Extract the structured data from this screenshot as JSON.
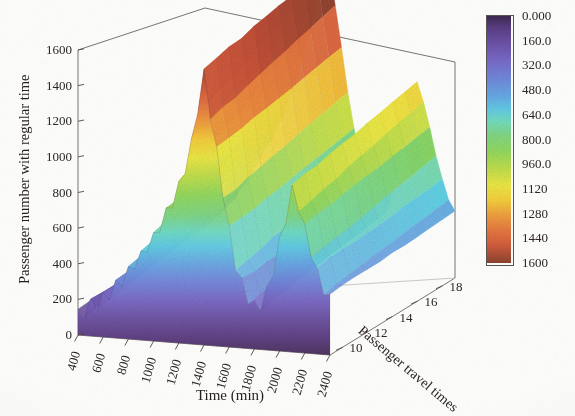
{
  "chart_data": {
    "type": "surface3d",
    "title": "",
    "xlabel": "Time (min)",
    "ylabel": "Passenger travel times",
    "zlabel": "Passenger number with regular time",
    "xticks": [
      "400",
      "600",
      "800",
      "1000",
      "1200",
      "1400",
      "1600",
      "1800",
      "2000",
      "2200",
      "2400"
    ],
    "yticks": [
      "10",
      "12",
      "14",
      "16",
      "18"
    ],
    "zticks": [
      "0",
      "200",
      "400",
      "600",
      "800",
      "1000",
      "1200",
      "1400",
      "1600"
    ],
    "xlim": [
      400,
      2400
    ],
    "ylim": [
      9,
      19
    ],
    "zlim": [
      0,
      1600
    ],
    "grid": false,
    "legend_position": "right",
    "colorbar": {
      "label": "",
      "ticks": [
        "0.000",
        "160.0",
        "320.0",
        "480.0",
        "640.0",
        "800.0",
        "960.0",
        "1120",
        "1280",
        "1440",
        "1600"
      ],
      "vmin": 0,
      "vmax": 1600,
      "colormap": "reversed-jet",
      "stops": [
        "#4a2f5e",
        "#6b4fa0",
        "#7d6fd0",
        "#6fa8e8",
        "#63d5e8",
        "#7de0b4",
        "#86d96a",
        "#c6e34e",
        "#f3ec46",
        "#f7c23c",
        "#f0883f",
        "#e06a42",
        "#c75038",
        "#8c4430"
      ]
    },
    "x": [
      400,
      450,
      500,
      550,
      600,
      650,
      700,
      750,
      800,
      850,
      900,
      950,
      1000,
      1050,
      1100,
      1150,
      1200,
      1250,
      1300,
      1350,
      1400,
      1450,
      1500,
      1550,
      1600,
      1650,
      1700,
      1750,
      1800,
      1850,
      1900,
      1950,
      2000,
      2050,
      2100,
      2150,
      2200,
      2250,
      2300,
      2350,
      2400
    ],
    "y": [
      9,
      10,
      11,
      12,
      13,
      14,
      15,
      16,
      17,
      18,
      19
    ],
    "z_front_profile": [
      120,
      140,
      165,
      190,
      215,
      250,
      285,
      330,
      380,
      430,
      470,
      520,
      575,
      640,
      710,
      790,
      880,
      980,
      1120,
      1320,
      1520,
      1300,
      1080,
      860,
      640,
      470,
      350,
      280,
      240,
      260,
      330,
      450,
      600,
      760,
      900,
      820,
      690,
      560,
      450,
      370,
      310
    ],
    "z_back_profile": [
      180,
      205,
      235,
      270,
      305,
      350,
      400,
      455,
      515,
      580,
      640,
      705,
      780,
      865,
      960,
      1070,
      1190,
      1330,
      1490,
      1620,
      1700,
      1480,
      1240,
      1000,
      790,
      600,
      460,
      370,
      310,
      340,
      430,
      580,
      760,
      940,
      1080,
      980,
      830,
      680,
      545,
      440,
      370
    ],
    "peaks": [
      {
        "name": "morning-peak",
        "x": 1400,
        "z": 1700
      },
      {
        "name": "valley",
        "x": 1800,
        "z": 250
      },
      {
        "name": "evening-peak",
        "x": 2100,
        "z": 1250
      }
    ]
  }
}
